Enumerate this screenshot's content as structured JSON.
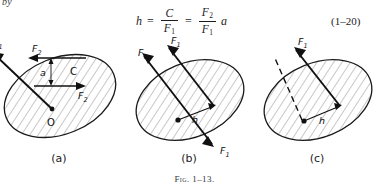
{
  "page": {
    "width": 389,
    "height": 195,
    "background": "#ffffff",
    "ink": "#1a1a1a"
  },
  "running_text": {
    "fragment": "by"
  },
  "equation": {
    "lhs": "h",
    "equals_1": "=",
    "frac1": {
      "numerator": "C",
      "denominator": "F",
      "denominator_sub": "1"
    },
    "equals_2": "=",
    "frac2": {
      "numerator": "F",
      "numerator_sub": "2",
      "denominator": "F",
      "denominator_sub": "1"
    },
    "trailing_factor": "a",
    "number": "(1–20)"
  },
  "figure": {
    "caption_prefix": "Fig.",
    "caption_number": "1–13.",
    "panels": [
      {
        "id": "a",
        "label": "(a)",
        "shape": "hatched-ellipse",
        "annotations": [
          {
            "name": "force-label-top",
            "text": "F",
            "sub": "2"
          },
          {
            "name": "force-label-bottom",
            "text": "F",
            "sub": "2"
          },
          {
            "name": "distance-label",
            "text": "a"
          },
          {
            "name": "point-label-c",
            "text": "C"
          },
          {
            "name": "point-label-o",
            "text": "O"
          },
          {
            "name": "force-label-clipped",
            "text": "F",
            "sub": "1"
          }
        ]
      },
      {
        "id": "b",
        "label": "(b)",
        "shape": "hatched-ellipse",
        "annotations": [
          {
            "name": "force-label-upper-right",
            "text": "F",
            "sub": "1"
          },
          {
            "name": "force-label-upper-left",
            "text": "F",
            "sub": "1"
          },
          {
            "name": "force-label-lower-right",
            "text": "F",
            "sub": "1"
          },
          {
            "name": "distance-label",
            "text": "h"
          }
        ]
      },
      {
        "id": "c",
        "label": "(c)",
        "shape": "hatched-ellipse",
        "annotations": [
          {
            "name": "force-label-upper-right",
            "text": "F",
            "sub": "1"
          },
          {
            "name": "distance-label",
            "text": "h"
          }
        ]
      }
    ]
  }
}
